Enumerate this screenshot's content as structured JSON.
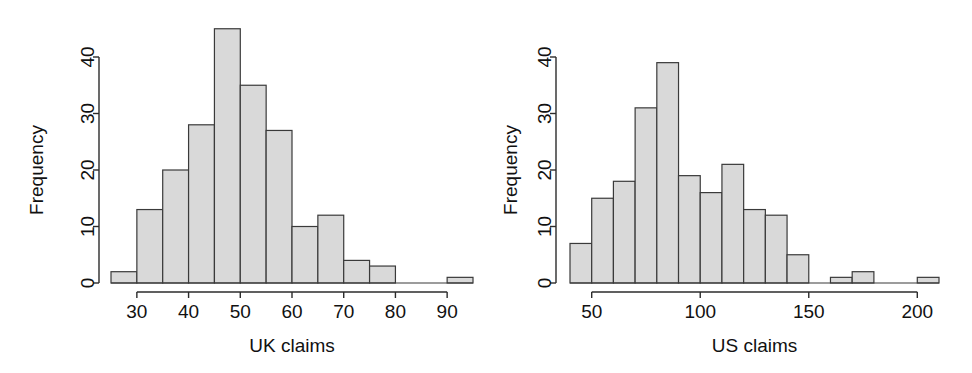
{
  "figure": {
    "background": "#ffffff",
    "panel_count": 2,
    "bar_fill": "#d9d9d9",
    "bar_stroke": "#3a3a3a",
    "axis_color": "#2b2b2b"
  },
  "chart_data": [
    {
      "id": "uk-claims-histogram",
      "type": "bar",
      "title": "",
      "xlabel": "UK claims",
      "ylabel": "Frequency",
      "xlim": [
        25,
        95
      ],
      "ylim": [
        0,
        46
      ],
      "xticks": [
        30,
        40,
        50,
        60,
        70,
        80,
        90
      ],
      "xtick_labels": [
        "30",
        "40",
        "50",
        "60",
        "70",
        "80",
        "90"
      ],
      "yticks": [
        0,
        10,
        20,
        30,
        40
      ],
      "ytick_labels": [
        "0",
        "10",
        "20",
        "30",
        "40"
      ],
      "grid": false,
      "legend": "none",
      "bin_width": 5,
      "bin_edges": [
        25,
        30,
        35,
        40,
        45,
        50,
        55,
        60,
        65,
        70,
        75,
        80,
        85,
        90,
        95
      ],
      "categories": [
        "25-30",
        "30-35",
        "35-40",
        "40-45",
        "45-50",
        "50-55",
        "55-60",
        "60-65",
        "65-70",
        "70-75",
        "75-80",
        "80-85",
        "85-90",
        "90-95"
      ],
      "values": [
        2,
        13,
        20,
        28,
        45,
        35,
        27,
        10,
        12,
        4,
        3,
        0,
        0,
        1
      ]
    },
    {
      "id": "us-claims-histogram",
      "type": "bar",
      "title": "",
      "xlabel": "US claims",
      "ylabel": "Frequency",
      "xlim": [
        40,
        210
      ],
      "ylim": [
        0,
        40
      ],
      "xticks": [
        50,
        100,
        150,
        200
      ],
      "xtick_labels": [
        "50",
        "100",
        "150",
        "200"
      ],
      "yticks": [
        0,
        10,
        20,
        30,
        40
      ],
      "ytick_labels": [
        "0",
        "10",
        "20",
        "30",
        "40"
      ],
      "grid": false,
      "legend": "none",
      "bin_width": 10,
      "bin_edges": [
        40,
        50,
        60,
        70,
        80,
        90,
        100,
        110,
        120,
        130,
        140,
        150,
        160,
        170,
        180,
        190,
        200,
        210
      ],
      "categories": [
        "40-50",
        "50-60",
        "60-70",
        "70-80",
        "80-90",
        "90-100",
        "100-110",
        "110-120",
        "120-130",
        "130-140",
        "140-150",
        "150-160",
        "160-170",
        "170-180",
        "180-190",
        "190-200",
        "200-210"
      ],
      "values": [
        7,
        15,
        18,
        31,
        39,
        19,
        16,
        21,
        13,
        12,
        5,
        0,
        1,
        2,
        0,
        0,
        1
      ]
    }
  ]
}
